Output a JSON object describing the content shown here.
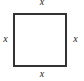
{
  "figure": {
    "type": "square-with-side-labels",
    "shape_name": "square",
    "stroke_color": "#333333",
    "fill_color": "#ffffff",
    "background_color": "#ffffff",
    "labels": {
      "top": "x",
      "right": "x",
      "bottom": "x",
      "left": "x"
    }
  }
}
